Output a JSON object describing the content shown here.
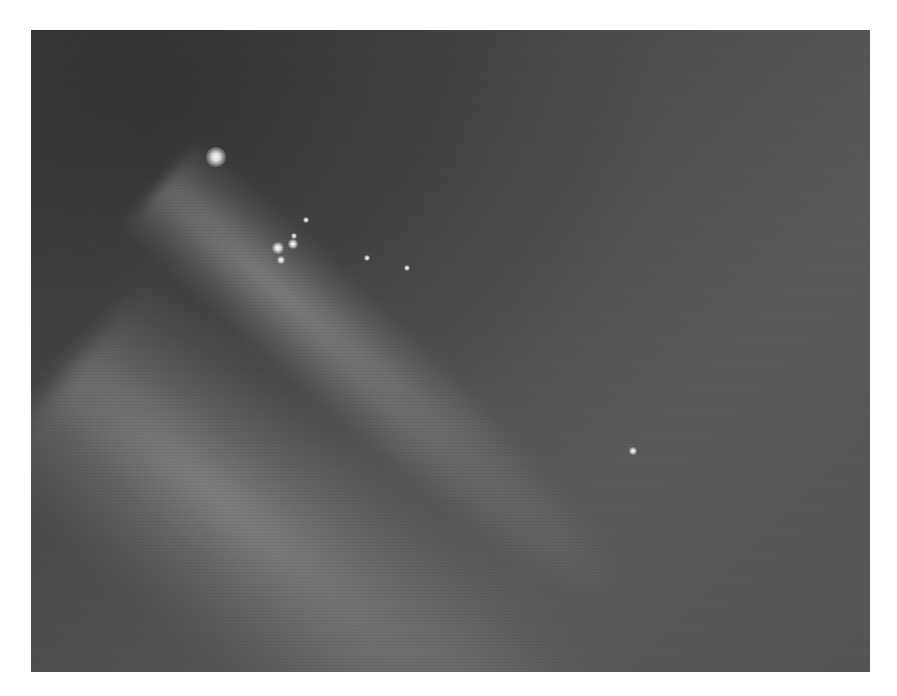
{
  "image": {
    "subject": "comet fragments with diffuse tail",
    "description": "Grayscale astronomical photograph of a fragmented comet: bright primary nucleus at upper-left with a chain of smaller fragments and a broad diffuse tail extending toward the lower-right",
    "colors": {
      "page_background": "#ffffff",
      "sky_dark": "#404040",
      "sky_light": "#5a5a5a",
      "nucleus": "#ffffff"
    },
    "fragments": [
      {
        "x": 185,
        "y": 127,
        "size": 20,
        "label": "primary-nucleus"
      },
      {
        "x": 247,
        "y": 218,
        "size": 12
      },
      {
        "x": 262,
        "y": 214,
        "size": 10
      },
      {
        "x": 250,
        "y": 230,
        "size": 8
      },
      {
        "x": 263,
        "y": 206,
        "size": 6
      },
      {
        "x": 275,
        "y": 190,
        "size": 6
      },
      {
        "x": 336,
        "y": 228,
        "size": 6
      },
      {
        "x": 376,
        "y": 238,
        "size": 6
      },
      {
        "x": 602,
        "y": 421,
        "size": 8
      }
    ]
  }
}
